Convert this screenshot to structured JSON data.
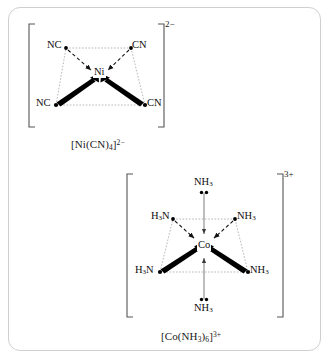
{
  "figure": {
    "name": "coordination-complex-geometries",
    "border_color": "#cfcfcf",
    "background": "#ffffff"
  },
  "complexes": [
    {
      "id": "nickel-tetracyanonickelate",
      "geometry": "square-planar",
      "metal": "Ni",
      "charge": "2−",
      "caption_formula": "[Ni(CN)",
      "caption_sub": "4",
      "caption_close": "]",
      "caption_sup": "2−",
      "caption_full": "[Ni(CN)4]2−",
      "ligands": [
        {
          "label": "NC",
          "position": "upper-left",
          "bond_style": "dashed-arrow"
        },
        {
          "label": "CN",
          "position": "upper-right",
          "bond_style": "dashed-arrow"
        },
        {
          "label": "NC",
          "position": "lower-left",
          "bond_style": "bold-wedge-arrow"
        },
        {
          "label": "CN",
          "position": "lower-right",
          "bond_style": "bold-wedge-arrow"
        }
      ]
    },
    {
      "id": "cobalt-hexaamminecobalt",
      "geometry": "octahedral",
      "metal": "Co",
      "charge": "3+",
      "caption_formula": "[Co(NH",
      "caption_sub1": "3",
      "caption_mid": ")",
      "caption_sub2": "6",
      "caption_close": "]",
      "caption_sup": "3+",
      "caption_full": "[Co(NH3)6]3+",
      "ligands": [
        {
          "label": "NH3",
          "position": "axial-top",
          "bond_style": "plain-arrow",
          "lone_pair": "below"
        },
        {
          "label": "H3N",
          "position": "upper-left",
          "bond_style": "dashed-arrow",
          "lone_pair": "none"
        },
        {
          "label": "NH3",
          "position": "upper-right",
          "bond_style": "dashed-arrow",
          "lone_pair": "none"
        },
        {
          "label": "H3N",
          "position": "lower-left",
          "bond_style": "bold-wedge-arrow",
          "lone_pair": "none"
        },
        {
          "label": "NH3",
          "position": "lower-right",
          "bond_style": "bold-wedge-arrow",
          "lone_pair": "none"
        },
        {
          "label": "NH3",
          "position": "axial-bottom",
          "bond_style": "plain-arrow",
          "lone_pair": "above"
        }
      ]
    }
  ],
  "atom_text": {
    "ni_nc_upper_left": "NC",
    "ni_cn_upper_right": "CN",
    "ni_nc_lower_left": "NC",
    "ni_cn_lower_right": "CN",
    "ni_center": "Ni",
    "co_center": "Co",
    "co_nh3_top": "NH",
    "co_h3n_upper_left": "H",
    "co_nh3_upper_right": "NH",
    "co_h3n_lower_left": "H",
    "co_nh3_lower_right": "NH",
    "co_nh3_bottom": "NH",
    "sub_3": "3"
  },
  "charges": {
    "nickel": "2−",
    "cobalt": "3+"
  },
  "captions": {
    "nickel_open": "[Ni(CN)",
    "nickel_sub": "4",
    "nickel_close": "]",
    "nickel_sup": "2−",
    "cobalt_open": "[Co(NH",
    "cobalt_sub_a": "3",
    "cobalt_paren": ")",
    "cobalt_sub_b": "6",
    "cobalt_close": "]",
    "cobalt_sup": "3+"
  },
  "colors": {
    "ink": "#0d0d0d",
    "bond_thin": "#8f8f8f",
    "bond_dash": "#111111",
    "bracket": "#4d4d4d",
    "frame": "#cfcfcf"
  }
}
